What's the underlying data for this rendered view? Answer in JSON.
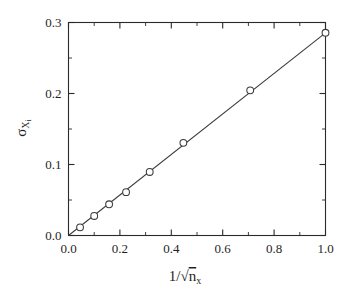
{
  "chart_data": {
    "type": "scatter",
    "title": "",
    "subtitle": "",
    "xlabel": "1/√nₓ",
    "ylabel": "σ_Xi",
    "xlabel_parts": {
      "numerator": "1",
      "slash": "/",
      "radicand_base": "n",
      "radicand_sub": "x"
    },
    "ylabel_parts": {
      "sigma": "σ",
      "sub_base": "X",
      "sub_sub": "i"
    },
    "xlim": [
      0.0,
      1.0
    ],
    "ylim": [
      0.0,
      0.3
    ],
    "xticks": [
      0.0,
      0.2,
      0.4,
      0.6,
      0.8,
      1.0
    ],
    "xtick_labels": [
      "0.0",
      "0.2",
      "0.4",
      "0.6",
      "0.8",
      "1.0"
    ],
    "yticks": [
      0.0,
      0.1,
      0.2,
      0.3
    ],
    "ytick_labels": [
      "0.0",
      "0.1",
      "0.2",
      "0.3"
    ],
    "x_minor_step": 0.1,
    "y_minor_step": 0.05,
    "grid": false,
    "legend": null,
    "legend_position": "none",
    "tick_direction": "in",
    "frame": "box",
    "marker": "open-circle",
    "marker_size": 4,
    "line_style": "solid",
    "series": [
      {
        "name": "sigma vs inverse sqrt n",
        "x": [
          0.045,
          0.1,
          0.158,
          0.224,
          0.316,
          0.447,
          0.707,
          1.0
        ],
        "y": [
          0.0115,
          0.0275,
          0.044,
          0.061,
          0.0895,
          0.1305,
          0.2045,
          0.2855
        ]
      }
    ],
    "fit": {
      "type": "line",
      "through_origin": true,
      "x": [
        0.0,
        1.0
      ],
      "y": [
        0.0,
        0.2855
      ],
      "slope": 0.2855,
      "intercept": 0.0
    },
    "colors": {
      "axis": "#2a2a2a",
      "line": "#3a3a3a",
      "marker_edge": "#3a3a3a",
      "marker_face": "#ffffff",
      "background": "#ffffff",
      "text": "#1f1f1f"
    }
  }
}
